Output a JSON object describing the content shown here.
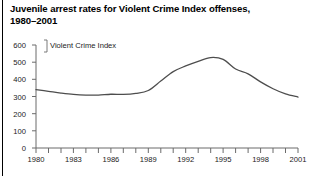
{
  "figure": {
    "title": "Juvenile arrest rates for Violent Crime Index offenses, 1980–2001",
    "title_line1": "Juvenile arrest rates for Violent Crime Index offenses,",
    "title_line2": "1980–2001",
    "series_label": "Violent Crime Index",
    "line_color": "#4d4d4d",
    "axis_color": "#6b6b6b",
    "text_color": "#000000",
    "background": "#ffffff"
  },
  "chart_data": {
    "type": "line",
    "title": "Juvenile arrest rates for Violent Crime Index offenses, 1980–2001",
    "xlabel": "",
    "ylabel": "",
    "grid": false,
    "legend_position": "inside-top-left",
    "annotations": [
      "Violent Crime Index"
    ],
    "xlim": [
      1980,
      2001
    ],
    "ylim": [
      0,
      600
    ],
    "ytick_labels": [
      "0",
      "100",
      "200",
      "300",
      "400",
      "500",
      "600"
    ],
    "yticks": [
      0,
      100,
      200,
      300,
      400,
      500,
      600
    ],
    "xtick_labels": [
      "1980",
      "1983",
      "1986",
      "1989",
      "1992",
      "1995",
      "1998",
      "2001"
    ],
    "xticks_labeled": [
      1980,
      1983,
      1986,
      1989,
      1992,
      1995,
      1998,
      2001
    ],
    "xticks_minor": [
      1981,
      1982,
      1984,
      1985,
      1987,
      1988,
      1990,
      1991,
      1993,
      1994,
      1996,
      1997,
      1999,
      2000
    ],
    "x": [
      1980,
      1981,
      1982,
      1983,
      1984,
      1985,
      1986,
      1987,
      1988,
      1989,
      1990,
      1991,
      1992,
      1993,
      1994,
      1995,
      1996,
      1997,
      1998,
      1999,
      2000,
      2001
    ],
    "series": [
      {
        "name": "Violent Crime Index",
        "values": [
          340,
          330,
          320,
          312,
          308,
          308,
          313,
          312,
          318,
          335,
          390,
          445,
          478,
          505,
          527,
          516,
          460,
          432,
          385,
          345,
          315,
          297
        ]
      }
    ]
  }
}
